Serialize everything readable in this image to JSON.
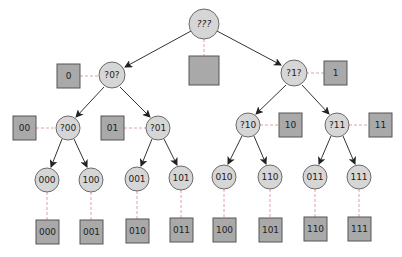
{
  "diagram": {
    "type": "binary-tree",
    "colors": {
      "node_fill": "#d6d6d6",
      "node_stroke": "#6a6a6a",
      "box_fill": "#a9a9a9",
      "box_stroke": "#555555",
      "edge": "#333333",
      "dashed_link": "#e0a0a0"
    },
    "nodes": {
      "root": {
        "label": "???",
        "box": ""
      },
      "n0": {
        "label": "?0?",
        "box": "0"
      },
      "n1": {
        "label": "?1?",
        "box": "1"
      },
      "n00": {
        "label": "?00",
        "box": "00"
      },
      "n01": {
        "label": "?01",
        "box": "01"
      },
      "n10": {
        "label": "?10",
        "box": "10"
      },
      "n11": {
        "label": "?11",
        "box": "11"
      }
    },
    "leaves": [
      {
        "label": "000",
        "box": "000"
      },
      {
        "label": "100",
        "box": "001"
      },
      {
        "label": "001",
        "box": "010"
      },
      {
        "label": "101",
        "box": "011"
      },
      {
        "label": "010",
        "box": "100"
      },
      {
        "label": "110",
        "box": "101"
      },
      {
        "label": "011",
        "box": "110"
      },
      {
        "label": "111",
        "box": "111"
      }
    ]
  }
}
